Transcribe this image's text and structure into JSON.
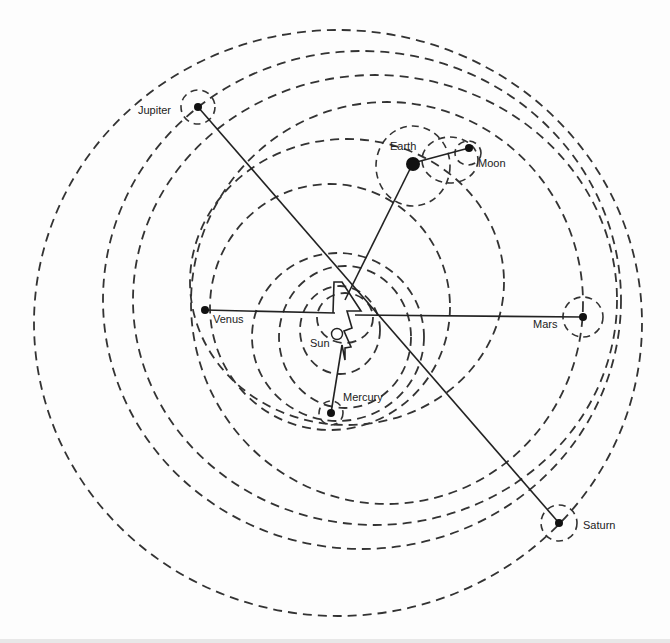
{
  "diagram": {
    "labels": {
      "jupiter": "Jupiter",
      "earth": "Earth",
      "moon": "Moon",
      "venus": "Venus",
      "mars": "Mars",
      "sun": "Sun",
      "mercury": "Mercury",
      "saturn": "Saturn"
    },
    "colors": {
      "stroke": "#333333",
      "planet": "#111111",
      "background": "#fdfdfd"
    }
  }
}
